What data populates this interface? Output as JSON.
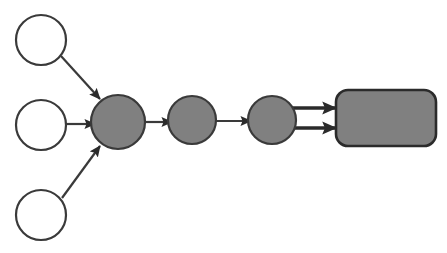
{
  "canvas": {
    "width": 447,
    "height": 253,
    "background_color": "#ffffff",
    "title": "Node graph diagram"
  },
  "style": {
    "hollow_fill": "#ffffff",
    "filled_fill": "#808080",
    "stroke_color": "#3a3a3a",
    "stroke_color_dark": "#2b2b2b",
    "stroke_width": 2,
    "edge_stroke_width": 2.2,
    "arrowhead_color": "#2b2b2b"
  },
  "nodes": [
    {
      "id": "input-top",
      "label": "",
      "shape": "circle",
      "fill": "hollow",
      "cx": 41,
      "cy": 40,
      "r": 25
    },
    {
      "id": "input-middle",
      "label": "",
      "shape": "circle",
      "fill": "hollow",
      "cx": 41,
      "cy": 125,
      "r": 25
    },
    {
      "id": "input-bottom",
      "label": "",
      "shape": "circle",
      "fill": "hollow",
      "cx": 41,
      "cy": 215,
      "r": 25
    },
    {
      "id": "hub",
      "label": "",
      "shape": "circle",
      "fill": "filled",
      "cx": 118,
      "cy": 122,
      "r": 27
    },
    {
      "id": "stage-2",
      "label": "",
      "shape": "circle",
      "fill": "filled",
      "cx": 192,
      "cy": 120,
      "r": 24
    },
    {
      "id": "stage-3",
      "label": "",
      "shape": "circle",
      "fill": "filled",
      "cx": 272,
      "cy": 120,
      "r": 24
    },
    {
      "id": "output-box",
      "label": "",
      "shape": "rounded-rect",
      "fill": "filled",
      "x": 336,
      "y": 90,
      "width": 100,
      "height": 56,
      "corner_radius": 12
    }
  ],
  "edges": [
    {
      "id": "edge-top-to-hub",
      "from": "input-top",
      "to": "hub",
      "kind": "diagonal-down",
      "x1": 61,
      "y1": 56,
      "x2": 100,
      "y2": 99,
      "arrowhead": "solid-triangle"
    },
    {
      "id": "edge-middle-to-hub",
      "from": "input-middle",
      "to": "hub",
      "kind": "horizontal",
      "x1": 66,
      "y1": 124,
      "x2": 93,
      "y2": 124,
      "arrowhead": "solid-triangle"
    },
    {
      "id": "edge-bottom-to-hub",
      "from": "input-bottom",
      "to": "hub",
      "kind": "diagonal-up",
      "x1": 62,
      "y1": 198,
      "x2": 100,
      "y2": 146,
      "arrowhead": "solid-triangle"
    },
    {
      "id": "edge-hub-to-stage2",
      "from": "hub",
      "to": "stage-2",
      "kind": "horizontal",
      "x1": 145,
      "y1": 122,
      "x2": 170,
      "y2": 122,
      "arrowhead": "solid-triangle"
    },
    {
      "id": "edge-stage2-to-stage3",
      "from": "stage-2",
      "to": "stage-3",
      "kind": "horizontal",
      "x1": 216,
      "y1": 121,
      "x2": 249,
      "y2": 121,
      "arrowhead": "solid-triangle"
    },
    {
      "id": "edge-stage3-to-output-upper",
      "from": "stage-3",
      "to": "output-box",
      "kind": "horizontal-thick",
      "x1": 293,
      "y1": 108,
      "x2": 333,
      "y2": 108,
      "arrowhead": "solid-triangle"
    },
    {
      "id": "edge-stage3-to-output-lower",
      "from": "stage-3",
      "to": "output-box",
      "kind": "horizontal-thick",
      "x1": 293,
      "y1": 128,
      "x2": 333,
      "y2": 128,
      "arrowhead": "solid-triangle"
    }
  ]
}
